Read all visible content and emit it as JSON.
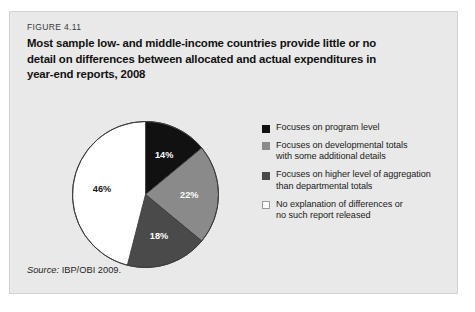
{
  "figure": {
    "number": "FIGURE 4.11",
    "title_lines": [
      "Most sample low- and middle-income countries provide little or no",
      "detail on differences between allocated and actual expenditures in",
      "year-end reports, 2008"
    ],
    "source_label": "Source:",
    "source_text": " IBP/OBI 2009."
  },
  "chart_data": {
    "type": "pie",
    "title": "Most sample low- and middle-income countries provide little or no detail on differences between allocated and actual expenditures in year-end reports, 2008",
    "categories": [
      "Focuses on program level",
      "Focuses on developmental totals with some additional details",
      "Focuses on higher level of aggregation than departmental totals",
      "No explanation of differences or no such report released"
    ],
    "values": [
      14,
      22,
      18,
      46
    ],
    "value_labels": [
      "14%",
      "22%",
      "18%",
      "46%"
    ],
    "colors": [
      "#111111",
      "#8a8a8a",
      "#4a4a4a",
      "#ffffff"
    ],
    "label_text_colors": [
      "#ffffff",
      "#ffffff",
      "#ffffff",
      "#1a1a1a"
    ],
    "unit": "percent",
    "start_angle_deg": 0,
    "direction": "clockwise",
    "legend_position": "right",
    "grid": false
  },
  "legend": {
    "items": [
      {
        "swatch": "#111111",
        "lines": [
          "Focuses on program level"
        ]
      },
      {
        "swatch": "#8a8a8a",
        "lines": [
          "Focuses on developmental totals",
          "with some additional details"
        ]
      },
      {
        "swatch": "#4a4a4a",
        "lines": [
          "Focuses on higher level of aggregation",
          "than departmental totals"
        ]
      },
      {
        "swatch": "#ffffff",
        "lines": [
          "No explanation of differences or",
          "no such report released"
        ]
      }
    ]
  }
}
